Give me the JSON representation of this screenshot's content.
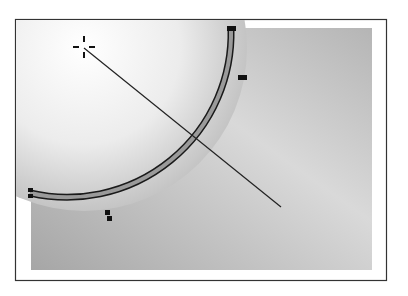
{
  "diagram": {
    "type": "vector-illustration",
    "frame": {
      "x": 15,
      "y": 19,
      "width": 372,
      "height": 262,
      "stroke": "#333333"
    },
    "background_rect": {
      "x": 31,
      "y": 28,
      "width": 341,
      "height": 242,
      "color_dark": "#a9a9a9",
      "color_light": "#dcdcdc"
    },
    "circle": {
      "center": [
        84,
        48
      ],
      "radius": 164,
      "fill_light": "#ffffff",
      "fill_dark": "#b8b8b8",
      "stroke_outer": "#1a1a1a",
      "stroke_inner": "#999999",
      "anchor_points": [
        {
          "x": 231,
          "y": 29
        },
        {
          "x": 243,
          "y": 77
        },
        {
          "x": 108,
          "y": 215
        },
        {
          "x": 30,
          "y": 193
        }
      ]
    },
    "center_crosshair": {
      "x": 84,
      "y": 48
    },
    "gradient_line": {
      "x1": 84,
      "y1": 48,
      "x2": 281,
      "y2": 207,
      "color": "#222222"
    }
  }
}
